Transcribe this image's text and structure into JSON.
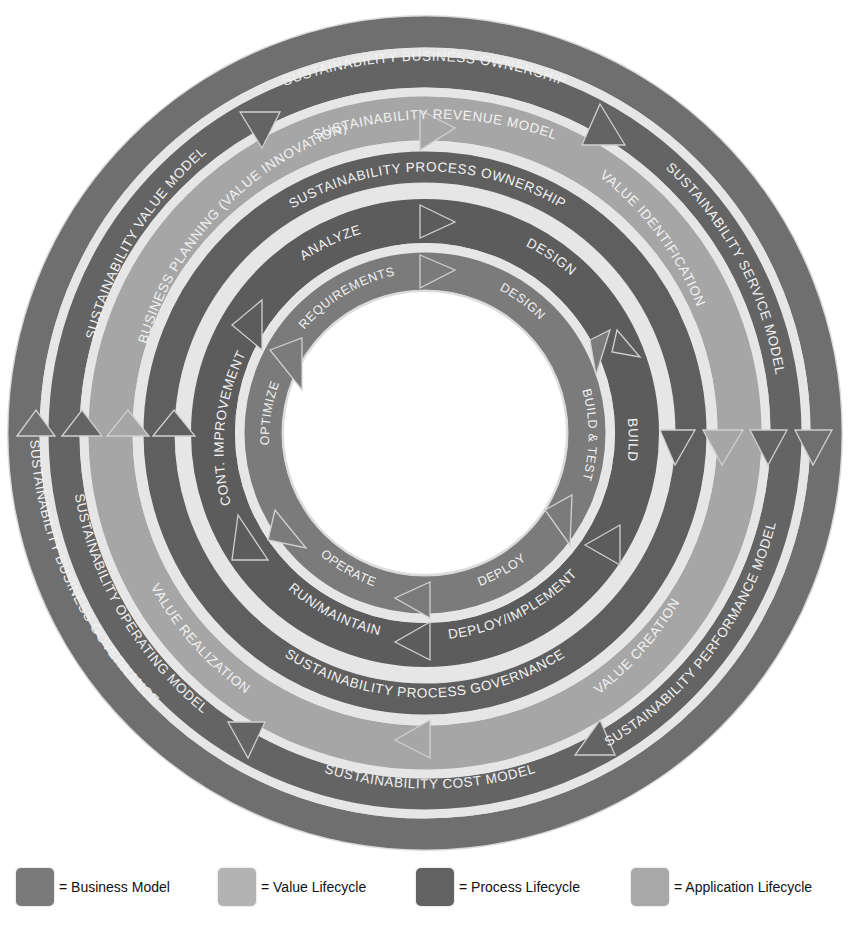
{
  "diagram": {
    "center": {
      "x": 425,
      "y": 433
    },
    "rings": [
      {
        "id": "business-ownership-ring",
        "category": "business_model",
        "r_outer": 416,
        "r_inner": 386,
        "labels": [
          {
            "text": "SUSTAINABILITY BUSINESS OWNERSHIP",
            "position": "top"
          },
          {
            "text": "SUSTAINABILITY BUSINESS GOVERNANCE",
            "position": "left"
          }
        ]
      },
      {
        "id": "business-model-ring",
        "category": "business_model",
        "r_outer": 376,
        "r_inner": 346,
        "labels": [
          {
            "text": "SUSTAINABILITY REVENUE MODEL",
            "position": "top"
          },
          {
            "text": "SUSTAINABILITY SERVICE MODEL",
            "position": "upper-right"
          },
          {
            "text": "SUSTAINABILITY PERFORMANCE MODEL",
            "position": "lower-right"
          },
          {
            "text": "SUSTAINABILITY COST MODEL",
            "position": "bottom"
          },
          {
            "text": "SUSTAINABILITY OPERATING MODEL",
            "position": "lower-left"
          },
          {
            "text": "SUSTAINABILITY VALUE MODEL",
            "position": "upper-left"
          }
        ]
      },
      {
        "id": "value-lifecycle-ring",
        "category": "value_lifecycle",
        "r_outer": 336,
        "r_inner": 293,
        "labels": [
          {
            "text": "BUSINESS PLANNING (VALUE INNOVATION)",
            "position": "upper-left"
          },
          {
            "text": "VALUE IDENTIFICATION",
            "position": "upper-right"
          },
          {
            "text": "VALUE CREATION",
            "position": "lower-right"
          },
          {
            "text": "VALUE REALIZATION",
            "position": "lower-left"
          }
        ]
      },
      {
        "id": "process-ownership-ring",
        "category": "process_lifecycle",
        "r_outer": 280,
        "r_inner": 250,
        "labels": [
          {
            "text": "SUSTAINABILITY PROCESS OWNERSHIP",
            "position": "top"
          },
          {
            "text": "SUSTAINABILITY PROCESS GOVERNANCE",
            "position": "bottom"
          }
        ]
      },
      {
        "id": "process-lifecycle-ring",
        "category": "process_lifecycle",
        "r_outer": 233,
        "r_inner": 190,
        "labels": [
          {
            "text": "ANALYZE",
            "position": "top-left"
          },
          {
            "text": "DESIGN",
            "position": "top-right"
          },
          {
            "text": "BUILD",
            "position": "right"
          },
          {
            "text": "DEPLOY/IMPLEMENT",
            "position": "bottom-right"
          },
          {
            "text": "RUN/MAINTAIN",
            "position": "bottom-left"
          },
          {
            "text": "CONT. IMPROVEMENT",
            "position": "left"
          }
        ]
      },
      {
        "id": "application-lifecycle-ring",
        "category": "application_lifecycle",
        "r_outer": 180,
        "r_inner": 143,
        "labels": [
          {
            "text": "REQUIREMENTS",
            "position": "top-left"
          },
          {
            "text": "DESIGN",
            "position": "top-right"
          },
          {
            "text": "BUILD & TEST",
            "position": "right"
          },
          {
            "text": "DEPLOY",
            "position": "bottom-right"
          },
          {
            "text": "OPERATE",
            "position": "bottom-left"
          },
          {
            "text": "OPTIMIZE",
            "position": "left"
          }
        ]
      }
    ]
  },
  "legend": {
    "items": [
      {
        "label": "= Business Model",
        "color": "#7a7a7a"
      },
      {
        "label": "= Value Lifecycle",
        "color": "#b3b3b3"
      },
      {
        "label": "= Process Lifecycle",
        "color": "#626262"
      },
      {
        "label": "= Application Lifecycle",
        "color": "#a8a8a8"
      }
    ]
  },
  "colors": {
    "business_model": "#6f6f6f",
    "value_lifecycle": "#a9a9a9",
    "process_lifecycle": "#5e5e5e",
    "application_lifecycle": "#7c7c7c",
    "separator": "#e4e4e4",
    "text": "#f4f4f4"
  }
}
